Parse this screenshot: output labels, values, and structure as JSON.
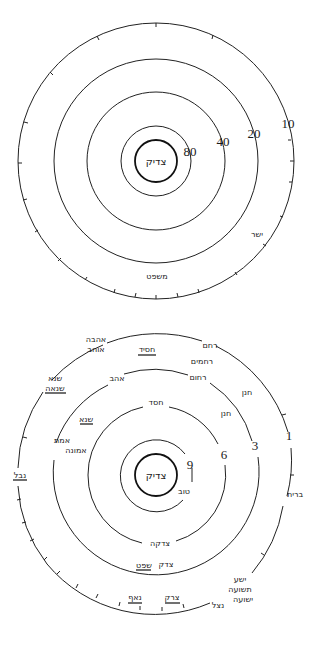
{
  "diagram_top": {
    "center_label": "צדיק",
    "rings": [
      {
        "value": "80"
      },
      {
        "value": "40"
      },
      {
        "value": "20"
      },
      {
        "value": "10"
      }
    ],
    "terms": [
      {
        "text": "ישר",
        "underlined": false
      },
      {
        "text": "משפט",
        "underlined": false
      }
    ]
  },
  "diagram_bottom": {
    "center_label": "צדיק",
    "rings": [
      {
        "value": "9"
      },
      {
        "value": "6"
      },
      {
        "value": "3"
      },
      {
        "value": "1"
      }
    ],
    "terms": {
      "outer_left_1": "אהבה",
      "outer_left_2": "אוהב",
      "hasid": "חסיד",
      "rehem": "רחם",
      "rahamim": "רחמים",
      "rahum": "רחום",
      "hanan_outer": "חנן",
      "hanan_inner": "חנן",
      "ahav": "אהב",
      "sone": "שנא",
      "sinah": "שנאה",
      "sane_inner": "שנא",
      "emet": "אמת",
      "emunah": "אמונה",
      "naval": "נבל",
      "hesed": "חסד",
      "tov": "טוב",
      "berit": "ברית",
      "tsedakah": "צדקה",
      "tsedek": "צדק",
      "shofet": "שפט",
      "naaf": "נאף",
      "tsarak": "צרק",
      "yesha": "ישע",
      "teshuah": "תשועה",
      "yeshuah": "ישועה",
      "natsal": "נצל"
    }
  }
}
